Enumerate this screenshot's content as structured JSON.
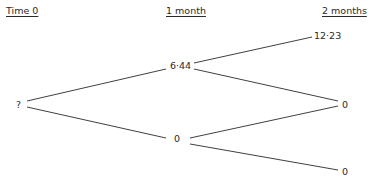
{
  "headers": {
    "time0": "Time 0",
    "month1": "1 month",
    "month2": "2 months"
  },
  "nodes": {
    "root": "?",
    "up": "6·44",
    "down": "0",
    "uu": "12·23",
    "ud": "0",
    "dd": "0"
  }
}
